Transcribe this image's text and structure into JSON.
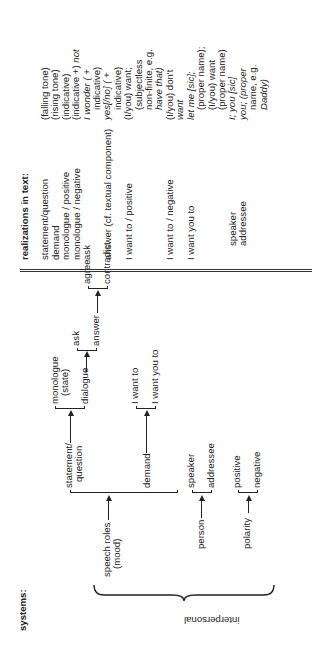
{
  "systems": {
    "heading": "systems:",
    "group_label": "interpersonal",
    "speech_roles": {
      "label_line1": "speech roles",
      "label_line2": "(mood)",
      "options": [
        "statement/",
        "question",
        "demand"
      ],
      "statement_branch": {
        "options_line1": "monologue",
        "options_line2": "(state)",
        "dialogue": "dialogue",
        "dialogue_branch": {
          "ask": "ask",
          "answer": "answer",
          "answer_branch": {
            "agree": "agree",
            "contradict": "contradict"
          }
        }
      },
      "demand_branch": {
        "i_want_to": "I want to",
        "i_want_you_to": "I want you to"
      }
    },
    "person": {
      "label": "person",
      "speaker": "speaker",
      "addressee": "addressee"
    },
    "polarity": {
      "label": "polarity",
      "positive": "positive",
      "negative": "negative"
    }
  },
  "realizations": {
    "heading": "realizations in text:",
    "rows": [
      "statement/question",
      "demand",
      "monologue / positive",
      "monologue / negative",
      "ask",
      "",
      "answer (cf. textual component)",
      "",
      "I want to / positive",
      "",
      "",
      "",
      "I want to / negative",
      "",
      "I want you to",
      "",
      "",
      "",
      "speaker",
      "addressee"
    ]
  },
  "realization_values": {
    "lines": [
      {
        "t": "(falling tone)",
        "it": false,
        "ind": false
      },
      {
        "t": "(rising tone)",
        "it": false,
        "ind": false
      },
      {
        "t": "(indicative)",
        "it": false,
        "ind": false
      },
      {
        "t": "(indicative +) not",
        "it": false,
        "ind": false
      },
      {
        "t": "I wonder ( +",
        "it": true,
        "ind": false
      },
      {
        "t": "indicative)",
        "it": false,
        "ind": true
      },
      {
        "t": "yes[/no] ( +",
        "it": true,
        "ind": false
      },
      {
        "t": "indicative)",
        "it": false,
        "ind": true
      },
      {
        "t": "(I/you) want;",
        "it": false,
        "ind": false
      },
      {
        "t": "(subjectless",
        "it": false,
        "ind": true
      },
      {
        "t": "non-finite, e.g.",
        "it": false,
        "ind": true
      },
      {
        "t": "have that)",
        "it": true,
        "ind": true
      },
      {
        "t": "(I/you) don't",
        "it": false,
        "ind": false
      },
      {
        "t": "want",
        "it": true,
        "ind": false
      },
      {
        "t": "let me [sic];",
        "it": true,
        "ind": false
      },
      {
        "t": "(proper name);",
        "it": false,
        "ind": true
      },
      {
        "t": "(I/you) want",
        "it": false,
        "ind": true
      },
      {
        "t": "(proper name)",
        "it": false,
        "ind": true
      },
      {
        "t": "I; you [sic]",
        "it": true,
        "ind": false
      },
      {
        "t": "you; (proper",
        "it": true,
        "ind": false
      },
      {
        "t": "name, e.g.",
        "it": false,
        "ind": true
      },
      {
        "t": "Daddy)",
        "it": true,
        "ind": true
      }
    ]
  }
}
